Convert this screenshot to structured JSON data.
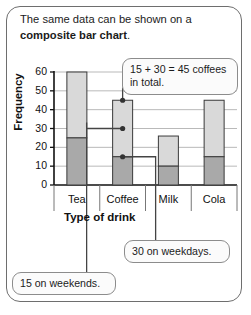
{
  "card": {
    "heading_line1": "The same data can be shown on a",
    "heading_bold": "composite bar chart",
    "heading_end": "."
  },
  "chart_data": {
    "type": "bar",
    "stacked": true,
    "title": "",
    "xlabel": "Type of drink",
    "ylabel": "Frequency",
    "categories": [
      "Tea",
      "Coffee",
      "Milk",
      "Cola"
    ],
    "ylim": [
      0,
      60
    ],
    "yticks": [
      "0",
      "10",
      "20",
      "30",
      "40",
      "50",
      "60"
    ],
    "grid": true,
    "legend": "none",
    "series": [
      {
        "name": "weekends",
        "color": "#a9a9a9",
        "values": [
          25,
          15,
          10,
          15
        ]
      },
      {
        "name": "weekdays",
        "color": "#d9d9d9",
        "values": [
          35,
          30,
          16,
          30
        ]
      }
    ],
    "totals": [
      60,
      45,
      26,
      45
    ],
    "annotations": [
      {
        "name": "total-callout",
        "text": "15 + 30 = 45 coffees in total.",
        "target": "Coffee",
        "value": 45
      },
      {
        "name": "weekdays-callout",
        "text": "30 on weekdays.",
        "target": "Coffee",
        "value": 30
      },
      {
        "name": "weekends-callout",
        "text": "15 on weekends.",
        "target": "Coffee",
        "value": 15
      }
    ]
  },
  "colors": {
    "card_border": "#6e6e6e",
    "bar_dark": "#a9a9a9",
    "bar_light": "#d9d9d9",
    "bar_stroke": "#3a3a3a",
    "grid": "#b9b9b9",
    "axis": "#111111",
    "callout_border": "#8c8c8c",
    "callout_bg": "#fbfbfb"
  }
}
